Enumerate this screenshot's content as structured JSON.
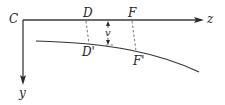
{
  "diagram": {
    "type": "elastic-curve-deflection",
    "origin_label": "C",
    "x_axis_label": "z",
    "y_axis_label": "y",
    "points_on_axis": [
      {
        "label": "D"
      },
      {
        "label": "F"
      }
    ],
    "points_on_curve": [
      {
        "label": "D'"
      },
      {
        "label": "F'"
      }
    ],
    "deflection_label": "v",
    "colors": {
      "line": "#333333",
      "background": "#ffffff"
    }
  }
}
